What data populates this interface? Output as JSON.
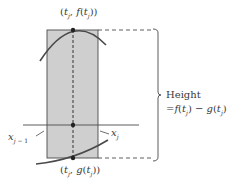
{
  "labels": {
    "top_point": "(t_j, f(t_j))",
    "bottom_point": "(t_j, g(t_j))",
    "left_x": "x_{j-1}",
    "right_x": "x_j",
    "height_title": "Height",
    "height_formula": "=f(t_j) − g(t_j)"
  },
  "colors": {
    "rectangle_fill": "#cfcfcf",
    "stroke": "#4a4a4a",
    "background": "#ffffff"
  },
  "geometry": {
    "rect": {
      "x": 47,
      "y": 30,
      "width": 51,
      "height": 128
    },
    "axis_y": 125,
    "t_x": 73,
    "top_y": 30,
    "bottom_y": 158
  }
}
